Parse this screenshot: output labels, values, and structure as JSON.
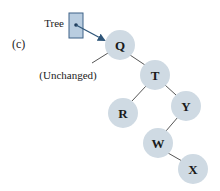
{
  "figure": {
    "panel_label": "(c)",
    "pointer": {
      "label": "Tree",
      "box_fill": "#b9cde0",
      "box_stroke": "#3f6388",
      "arrow_color": "#2f5679"
    },
    "annotation": {
      "text": "(Unchanged)"
    },
    "colors": {
      "node_fill": "#cfdae3",
      "edge": "#555555"
    },
    "nodes": [
      {
        "id": "Q",
        "label": "Q",
        "cx": 120,
        "cy": 45
      },
      {
        "id": "T",
        "label": "T",
        "cx": 155,
        "cy": 75
      },
      {
        "id": "R",
        "label": "R",
        "cx": 123,
        "cy": 113
      },
      {
        "id": "Y",
        "label": "Y",
        "cx": 186,
        "cy": 106
      },
      {
        "id": "W",
        "label": "W",
        "cx": 158,
        "cy": 143
      },
      {
        "id": "X",
        "label": "X",
        "cx": 193,
        "cy": 169
      }
    ],
    "edges": [
      {
        "from": "Q",
        "to": "T"
      },
      {
        "from": "T",
        "to": "R"
      },
      {
        "from": "T",
        "to": "Y"
      },
      {
        "from": "Y",
        "to": "W"
      },
      {
        "from": "W",
        "to": "X"
      }
    ]
  }
}
